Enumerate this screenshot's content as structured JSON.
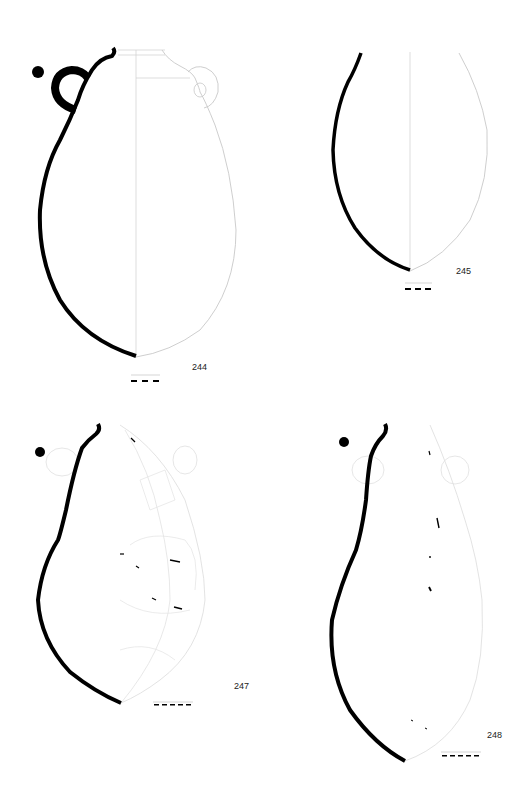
{
  "plate": {
    "background": "#ffffff",
    "section_color": "#000000",
    "outline_color": "#c8c8c8",
    "vessels": [
      {
        "id": "v244",
        "catalog_number": "244",
        "type": "two-handled jar (amphoriskos)",
        "handles": 2,
        "label_pos": [
          192,
          362
        ]
      },
      {
        "id": "v245",
        "catalog_number": "245",
        "type": "ovoid jar body fragment",
        "handles": 0,
        "label_pos": [
          456,
          266
        ]
      },
      {
        "id": "v247",
        "catalog_number": "247",
        "type": "two-handled jar, reconstructed from sherds",
        "handles": 2,
        "label_pos": [
          234,
          681
        ]
      },
      {
        "id": "v248",
        "catalog_number": "248",
        "type": "two-handled jar, fragmentary",
        "handles": 2,
        "label_pos": [
          487,
          730
        ]
      }
    ],
    "scale_bars": [
      {
        "vessel": "244",
        "segments": 3
      },
      {
        "vessel": "245",
        "segments": 3
      },
      {
        "vessel": "247",
        "segments": 5
      },
      {
        "vessel": "248",
        "segments": 5
      }
    ]
  }
}
